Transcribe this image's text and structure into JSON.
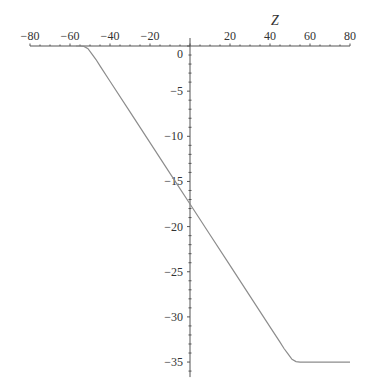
{
  "chart_data": {
    "type": "line",
    "title": "",
    "xlabel": "Z",
    "ylabel": "",
    "xlim": [
      -80,
      80
    ],
    "ylim": [
      -36,
      0
    ],
    "grid": false,
    "legend": null,
    "x_ticks": [
      -80,
      -60,
      -40,
      -20,
      20,
      40,
      60,
      80
    ],
    "x_tick_labels": [
      "−80",
      "−60",
      "−40",
      "−20",
      "20",
      "40",
      "60",
      "80"
    ],
    "x_minor_step": 5,
    "y_ticks": [
      0,
      -5,
      -10,
      -15,
      -20,
      -25,
      -30,
      -35
    ],
    "y_tick_labels": [
      "0",
      "−5",
      "−10",
      "−15",
      "−20",
      "−25",
      "−30",
      "−35"
    ],
    "y_minor_step": 1,
    "series": [
      {
        "name": "curve",
        "color": "#8c8c8c",
        "x": [
          -57,
          -55,
          -53,
          -51,
          -49,
          -47,
          -45,
          -40,
          -30,
          -20,
          -10,
          0,
          10,
          20,
          30,
          40,
          45,
          47,
          49,
          51,
          53,
          55,
          60,
          70,
          80
        ],
        "y": [
          0,
          0,
          -0.05,
          -0.3,
          -0.9,
          -1.5,
          -2.2,
          -3.9,
          -7.3,
          -10.7,
          -14.1,
          -17.5,
          -20.9,
          -24.3,
          -27.7,
          -31.1,
          -32.8,
          -33.5,
          -34.1,
          -34.7,
          -34.95,
          -35,
          -35,
          -35,
          -35
        ]
      }
    ]
  }
}
